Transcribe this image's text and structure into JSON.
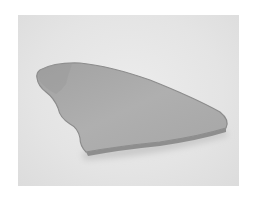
{
  "image": {
    "subject": "flat stone",
    "colors": {
      "border": "#ffffff",
      "backdrop": "#e6e6e6",
      "stone": "#a9a9a9",
      "stone_highlight": "#b8b8b8",
      "stone_edge": "#8a8a8a",
      "shadow": "#c4c4c4"
    }
  }
}
